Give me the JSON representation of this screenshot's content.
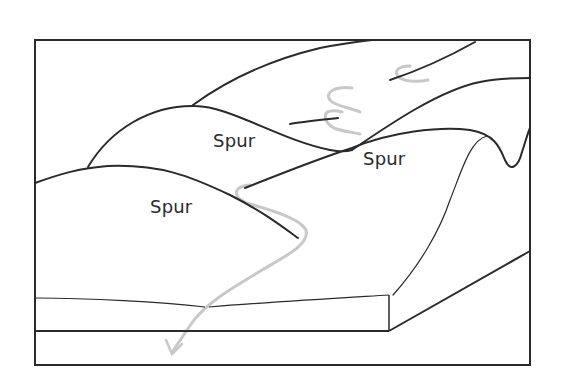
{
  "diagram": {
    "type": "block-diagram",
    "labels": [
      {
        "text": "Spur",
        "x": 213,
        "y": 130
      },
      {
        "text": "Spur",
        "x": 363,
        "y": 148
      },
      {
        "text": "Spur",
        "x": 150,
        "y": 196
      }
    ],
    "colors": {
      "outline": "#2a2a2a",
      "river": "#c8c8c8",
      "background": "#ffffff"
    }
  }
}
